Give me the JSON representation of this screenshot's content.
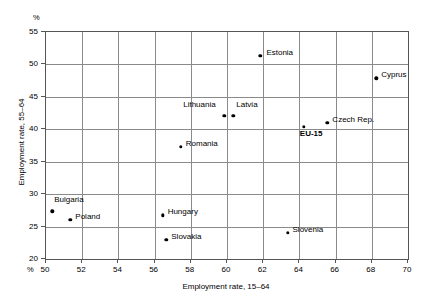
{
  "chart_data": {
    "type": "scatter",
    "title": "",
    "xlabel": "Employment rate, 15–64",
    "ylabel": "Employment rate, 55–64",
    "unit_label_top": "%",
    "unit_label_bottom": "%",
    "xlim": [
      50,
      70
    ],
    "ylim": [
      20,
      55
    ],
    "xticks": [
      50,
      52,
      54,
      56,
      58,
      60,
      62,
      64,
      66,
      68,
      70
    ],
    "yticks": [
      20,
      25,
      30,
      35,
      40,
      45,
      50,
      55
    ],
    "grid": true,
    "legend": "none",
    "marker_color": "#000000",
    "grid_color": "#8a8a8a",
    "frame_color": "#555555",
    "points": [
      {
        "label": "Estonia",
        "x": 61.9,
        "y": 51.2,
        "label_dx": 6,
        "label_dy": -4,
        "bold": false
      },
      {
        "label": "Cyprus",
        "x": 68.3,
        "y": 47.7,
        "label_dx": 5,
        "label_dy": -4,
        "bold": false
      },
      {
        "label": "Lithuania",
        "x": 59.9,
        "y": 41.9,
        "label_dx": -41,
        "label_dy": -12,
        "bold": false
      },
      {
        "label": "Latvia",
        "x": 60.4,
        "y": 41.9,
        "label_dx": 3,
        "label_dy": -12,
        "bold": false
      },
      {
        "label": "Czech Rep.",
        "x": 65.6,
        "y": 40.8,
        "label_dx": 5,
        "label_dy": -4,
        "bold": false
      },
      {
        "label": "EU-15",
        "x": 64.3,
        "y": 40.2,
        "label_dx": -4,
        "label_dy": 6,
        "bold": true
      },
      {
        "label": "Romania",
        "x": 57.5,
        "y": 37.1,
        "label_dx": 5,
        "label_dy": -4,
        "bold": false
      },
      {
        "label": "Bulgaria",
        "x": 50.4,
        "y": 27.2,
        "label_dx": 2,
        "label_dy": -12,
        "bold": false
      },
      {
        "label": "Hungary",
        "x": 56.5,
        "y": 26.6,
        "label_dx": 5,
        "label_dy": -4,
        "bold": false
      },
      {
        "label": "Poland",
        "x": 51.4,
        "y": 25.9,
        "label_dx": 5,
        "label_dy": -4,
        "bold": false
      },
      {
        "label": "Slovenia",
        "x": 63.4,
        "y": 23.9,
        "label_dx": 5,
        "label_dy": -4,
        "bold": false
      },
      {
        "label": "Slovakia",
        "x": 56.7,
        "y": 22.8,
        "label_dx": 5,
        "label_dy": -4,
        "bold": false
      }
    ]
  }
}
